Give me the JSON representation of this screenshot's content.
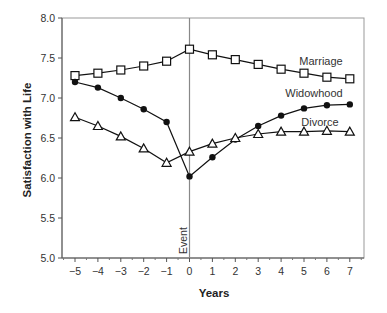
{
  "chart_data": {
    "type": "line",
    "title": "",
    "xlabel": "Years",
    "ylabel": "Satisfaction with Life",
    "x": [
      -5,
      -4,
      -3,
      -2,
      -1,
      0,
      1,
      2,
      3,
      4,
      5,
      6,
      7
    ],
    "xticks": [
      "−5",
      "−4",
      "−3",
      "−2",
      "−1",
      "0",
      "1",
      "2",
      "3",
      "4",
      "5",
      "6",
      "7"
    ],
    "ylim": [
      5.0,
      8.0
    ],
    "yticks": [
      "5.0",
      "5.5",
      "6.0",
      "6.5",
      "7.0",
      "7.5",
      "8.0"
    ],
    "grid": false,
    "legend": "inline labels",
    "annotations": [
      {
        "text": "Event",
        "x": 0,
        "orientation": "vertical"
      }
    ],
    "series": [
      {
        "name": "Marriage",
        "marker": "open-square",
        "values": [
          7.28,
          7.31,
          7.35,
          7.4,
          7.46,
          7.61,
          7.54,
          7.48,
          7.42,
          7.36,
          7.31,
          7.26,
          7.24
        ]
      },
      {
        "name": "Widowhood",
        "marker": "filled-circle",
        "values": [
          7.2,
          7.13,
          7.0,
          6.86,
          6.7,
          6.02,
          6.26,
          6.48,
          6.65,
          6.78,
          6.87,
          6.91,
          6.92
        ]
      },
      {
        "name": "Divorce",
        "marker": "open-triangle",
        "values": [
          6.76,
          6.65,
          6.52,
          6.37,
          6.19,
          6.33,
          6.43,
          6.5,
          6.55,
          6.58,
          6.58,
          6.59,
          6.58
        ]
      }
    ]
  },
  "labels": {
    "marriage": "Marriage",
    "widowhood": "Widowhood",
    "divorce": "Divorce",
    "event": "Event",
    "xlabel": "Years",
    "ylabel": "Satisfaction with Life"
  }
}
